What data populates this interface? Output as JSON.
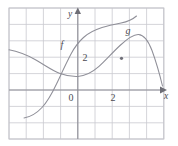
{
  "figure": {
    "kind": "math-graph",
    "background": "#ffffff",
    "grid_color": "#c9c9cf",
    "axis_color": "#8d8d95",
    "curve_color": "#8f8f98",
    "label_color": "#4a4a52"
  },
  "axes": {
    "x_axis_label": "x",
    "y_axis_label": "y",
    "origin_label": "0",
    "x_tick_label": "2",
    "y_tick_label": "2",
    "x_range": [
      -4,
      5
    ],
    "y_range": [
      -2,
      5
    ],
    "grid": "on",
    "grid_step": 1
  },
  "curves": [
    {
      "name": "f",
      "label": "f",
      "description": "downward-opening curve, local maximum near x=0",
      "points": [
        [
          -4.0,
          2.45
        ],
        [
          -3.5,
          2.35
        ],
        [
          -3.0,
          2.15
        ],
        [
          -2.5,
          1.85
        ],
        [
          -2.0,
          1.55
        ],
        [
          -1.5,
          1.28
        ],
        [
          -1.0,
          1.1
        ],
        [
          -0.5,
          1.02
        ],
        [
          0.0,
          1.02
        ],
        [
          0.5,
          1.12
        ],
        [
          1.0,
          1.38
        ],
        [
          1.5,
          1.78
        ],
        [
          2.0,
          2.25
        ],
        [
          2.5,
          2.7
        ],
        [
          3.0,
          3.0
        ],
        [
          3.5,
          2.95
        ],
        [
          4.0,
          2.45
        ],
        [
          4.5,
          1.55
        ],
        [
          4.9,
          0.45
        ]
      ]
    },
    {
      "name": "g",
      "label": "g",
      "description": "increasing S-shaped curve rising left to right",
      "points": [
        [
          -3.2,
          -1.55
        ],
        [
          -3.0,
          -1.5
        ],
        [
          -2.5,
          -1.3
        ],
        [
          -2.0,
          -0.92
        ],
        [
          -1.5,
          -0.38
        ],
        [
          -1.0,
          0.35
        ],
        [
          -0.5,
          1.2
        ],
        [
          0.0,
          2.05
        ],
        [
          0.5,
          2.75
        ],
        [
          1.0,
          3.25
        ],
        [
          1.5,
          3.55
        ],
        [
          2.0,
          3.72
        ],
        [
          2.5,
          3.8
        ],
        [
          3.0,
          3.95
        ],
        [
          3.1,
          4.05
        ]
      ]
    }
  ],
  "intersections": [
    {
      "x": -1.0,
      "y": 1.1,
      "marked": false
    },
    {
      "x": 2.0,
      "y": 2.25,
      "marked": true
    }
  ],
  "labels": {
    "f_label_pos": {
      "x": -0.6,
      "y": 3.0
    },
    "g_label_pos": {
      "x": 2.65,
      "y": 4.2
    }
  }
}
